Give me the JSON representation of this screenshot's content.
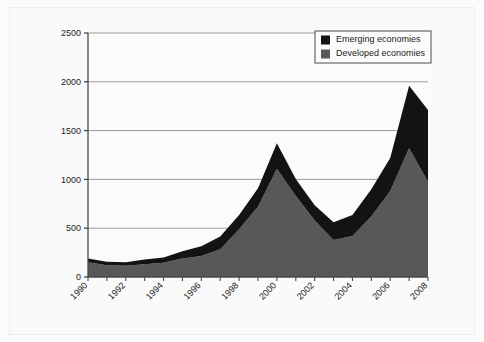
{
  "figure": {
    "background_color": "#fafafa",
    "border_color": "#ededed",
    "plot_background_color": "#fbfbfb"
  },
  "chart_data": {
    "type": "area",
    "stacked": true,
    "title": "",
    "subtitle": "",
    "xlabel": "",
    "ylabel": "",
    "xlim": [
      1990,
      2008
    ],
    "ylim": [
      0,
      2500
    ],
    "grid": true,
    "grid_axis": "y",
    "legend_position": "top-right",
    "x": [
      1990,
      1991,
      1992,
      1993,
      1994,
      1995,
      1996,
      1997,
      1998,
      1999,
      2000,
      2001,
      2002,
      2003,
      2004,
      2005,
      2006,
      2007,
      2008
    ],
    "xticks": [
      1990,
      1991,
      1992,
      1993,
      1994,
      1995,
      1996,
      1997,
      1998,
      1999,
      2000,
      2001,
      2002,
      2003,
      2004,
      2005,
      2006,
      2007,
      2008
    ],
    "xtick_labels": [
      "1990",
      "",
      "1992",
      "",
      "1994",
      "",
      "1996",
      "",
      "1998",
      "",
      "2000",
      "",
      "2002",
      "",
      "2004",
      "",
      "2006",
      "",
      "2008"
    ],
    "yticks": [
      0,
      500,
      1000,
      1500,
      2000,
      2500
    ],
    "ytick_labels": [
      "0",
      "500",
      "1000",
      "1500",
      "2000",
      "2500"
    ],
    "series": [
      {
        "name": "Developed economies",
        "color": "#585858",
        "values": [
          150,
          120,
          115,
          130,
          145,
          190,
          215,
          285,
          490,
          720,
          1110,
          830,
          580,
          380,
          420,
          620,
          880,
          1320,
          975
        ]
      },
      {
        "name": "Emerging economies",
        "color": "#131313",
        "values": [
          40,
          35,
          35,
          50,
          55,
          75,
          100,
          130,
          145,
          190,
          260,
          175,
          155,
          180,
          215,
          280,
          340,
          640,
          735
        ]
      }
    ],
    "totals": [
      190,
      155,
      150,
      180,
      200,
      265,
      315,
      415,
      635,
      910,
      1370,
      1005,
      735,
      560,
      635,
      900,
      1220,
      1960,
      1710
    ]
  },
  "legend": {
    "items": [
      {
        "label": "Emerging economies",
        "color": "#131313"
      },
      {
        "label": "Developed economies",
        "color": "#585858"
      }
    ],
    "border_color": "#4a4a4a",
    "background_color": "#fbfbfb"
  },
  "axes": {
    "axis_line_color": "#4a4a4a",
    "grid_line_color": "#8e8e8e"
  }
}
